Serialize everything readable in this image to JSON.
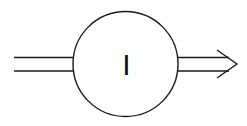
{
  "diagram": {
    "type": "block-flow",
    "node": {
      "shape": "circle",
      "label": "I"
    },
    "input": {
      "type": "double-line",
      "direction": "in"
    },
    "output": {
      "type": "double-line-arrow",
      "direction": "out"
    },
    "colors": {
      "stroke": "#1a1a1a",
      "background": "#ffffff"
    }
  }
}
